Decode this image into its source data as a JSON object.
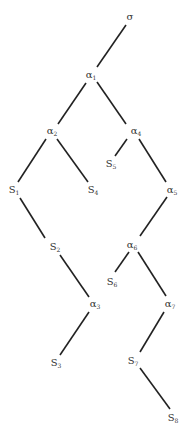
{
  "diagram": {
    "type": "tree",
    "line_color": "#222222",
    "nodes": [
      {
        "id": "sigma",
        "label": "σ",
        "sub": "",
        "x": 130,
        "y": 17
      },
      {
        "id": "a1",
        "label": "α",
        "sub": "1",
        "x": 91,
        "y": 75
      },
      {
        "id": "a2",
        "label": "α",
        "sub": "2",
        "x": 52,
        "y": 131
      },
      {
        "id": "a4",
        "label": "α",
        "sub": "4",
        "x": 136,
        "y": 131
      },
      {
        "id": "S1",
        "label": "S",
        "sub": "1",
        "x": 14,
        "y": 190
      },
      {
        "id": "S4",
        "label": "S",
        "sub": "4",
        "x": 93,
        "y": 190
      },
      {
        "id": "S5",
        "label": "S",
        "sub": "5",
        "x": 111,
        "y": 164
      },
      {
        "id": "a5",
        "label": "α",
        "sub": "5",
        "x": 172,
        "y": 190
      },
      {
        "id": "S2",
        "label": "S",
        "sub": "2",
        "x": 55,
        "y": 247
      },
      {
        "id": "a6",
        "label": "α",
        "sub": "6",
        "x": 132,
        "y": 245
      },
      {
        "id": "S6",
        "label": "S",
        "sub": "6",
        "x": 112,
        "y": 282
      },
      {
        "id": "a3",
        "label": "α",
        "sub": "3",
        "x": 95,
        "y": 304
      },
      {
        "id": "a7",
        "label": "α",
        "sub": "7",
        "x": 170,
        "y": 304
      },
      {
        "id": "S3",
        "label": "S",
        "sub": "3",
        "x": 56,
        "y": 363
      },
      {
        "id": "S7",
        "label": "S",
        "sub": "7",
        "x": 133,
        "y": 361
      },
      {
        "id": "S8",
        "label": "S",
        "sub": "8",
        "x": 173,
        "y": 418
      }
    ],
    "edges": [
      {
        "from": "sigma",
        "to": "a1",
        "x1": 126,
        "y1": 25,
        "x2": 97,
        "y2": 67
      },
      {
        "from": "a1",
        "to": "a2",
        "x1": 86,
        "y1": 83,
        "x2": 58,
        "y2": 124
      },
      {
        "from": "a1",
        "to": "a4",
        "x1": 97,
        "y1": 82,
        "x2": 126,
        "y2": 124
      },
      {
        "from": "a2",
        "to": "S1",
        "x1": 46,
        "y1": 139,
        "x2": 18,
        "y2": 182
      },
      {
        "from": "a2",
        "to": "S4",
        "x1": 57,
        "y1": 139,
        "x2": 88,
        "y2": 182
      },
      {
        "from": "a4",
        "to": "S5",
        "x1": 127,
        "y1": 139,
        "x2": 115,
        "y2": 156
      },
      {
        "from": "a4",
        "to": "a5",
        "x1": 139,
        "y1": 139,
        "x2": 166,
        "y2": 182
      },
      {
        "from": "S1",
        "to": "S2",
        "x1": 20,
        "y1": 198,
        "x2": 45,
        "y2": 238
      },
      {
        "from": "a5",
        "to": "a6",
        "x1": 167,
        "y1": 197,
        "x2": 140,
        "y2": 236
      },
      {
        "from": "a6",
        "to": "S6",
        "x1": 129,
        "y1": 252,
        "x2": 115,
        "y2": 272
      },
      {
        "from": "a6",
        "to": "a7",
        "x1": 138,
        "y1": 252,
        "x2": 166,
        "y2": 296
      },
      {
        "from": "S2",
        "to": "a3",
        "x1": 60,
        "y1": 255,
        "x2": 89,
        "y2": 297
      },
      {
        "from": "a3",
        "to": "S3",
        "x1": 89,
        "y1": 312,
        "x2": 60,
        "y2": 355
      },
      {
        "from": "a7",
        "to": "S7",
        "x1": 164,
        "y1": 312,
        "x2": 140,
        "y2": 352
      },
      {
        "from": "S7",
        "to": "S8",
        "x1": 140,
        "y1": 368,
        "x2": 170,
        "y2": 409
      }
    ]
  },
  "caption": "Figure 1 (partially cut off)"
}
